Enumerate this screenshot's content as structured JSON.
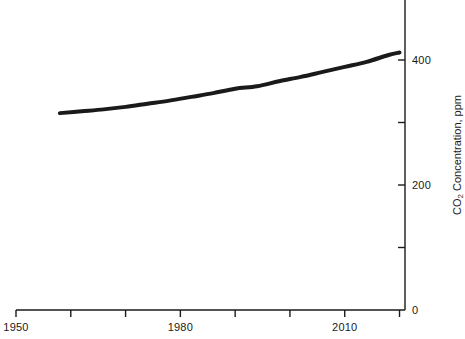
{
  "chart_data": {
    "type": "line",
    "title": "",
    "xlabel": "",
    "ylabel": "CO2 Concentration, ppm",
    "ylabel_parts": {
      "prefix": "CO",
      "subscript": "2",
      "suffix": " Concentration, ppm"
    },
    "xlim": [
      1950,
      2021
    ],
    "ylim": [
      0,
      481
    ],
    "grid": false,
    "legend": "none",
    "x_ticks_major": [
      1950,
      1980,
      2010
    ],
    "x_tick_labels": [
      "1950",
      "1980",
      "2010"
    ],
    "x_ticks_minor": [
      1960,
      1970,
      1990,
      2000,
      2020
    ],
    "y_ticks_major": [
      0,
      200,
      400
    ],
    "y_tick_labels": [
      "0",
      "200",
      "400"
    ],
    "y_ticks_minor": [
      100,
      300
    ],
    "y_axis_position": "right",
    "line_color": "#1a1a1a",
    "line_width_px": 4,
    "x": [
      1958,
      1962,
      1966,
      1970,
      1974,
      1978,
      1982,
      1986,
      1990,
      1994,
      1998,
      2002,
      2006,
      2010,
      2014,
      2018,
      2020
    ],
    "values": [
      315,
      318,
      321,
      325,
      330,
      335,
      341,
      347,
      354,
      358,
      366,
      373,
      381,
      389,
      397,
      408,
      412
    ],
    "series": [
      {
        "name": "CO2 Concentration",
        "values": [
          315,
          318,
          321,
          325,
          330,
          335,
          341,
          347,
          354,
          358,
          366,
          373,
          381,
          389,
          397,
          408,
          412
        ]
      }
    ],
    "annotations": []
  },
  "axes": {
    "x_axis_name": "year-axis",
    "y_axis_name": "co2-concentration-axis"
  }
}
